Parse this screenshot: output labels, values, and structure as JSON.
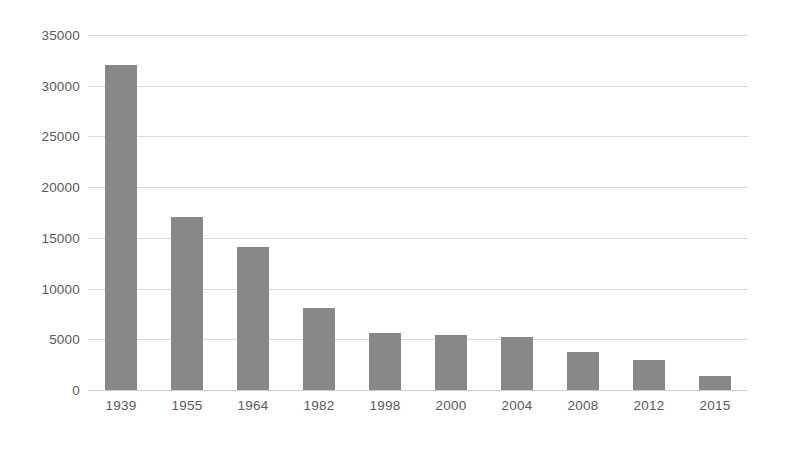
{
  "chart_data": {
    "type": "bar",
    "title": "",
    "subtitle": "",
    "xlabel": "",
    "ylabel": "",
    "categories": [
      "1939",
      "1955",
      "1964",
      "1982",
      "1998",
      "2000",
      "2004",
      "2008",
      "2012",
      "2015"
    ],
    "values": [
      32000,
      17100,
      14100,
      8100,
      5600,
      5400,
      5200,
      3700,
      3000,
      1400
    ],
    "series": [
      {
        "name": "",
        "values": [
          32000,
          17100,
          14100,
          8100,
          5600,
          5400,
          5200,
          3700,
          3000,
          1400
        ]
      }
    ],
    "ylim": [
      0,
      35000
    ],
    "ytick_labels": [
      "0",
      "5000",
      "10000",
      "15000",
      "20000",
      "25000",
      "30000",
      "35000"
    ],
    "ytick_values": [
      0,
      5000,
      10000,
      15000,
      20000,
      25000,
      30000,
      35000
    ],
    "grid": true,
    "grid_axis": "y",
    "legend": false,
    "legend_position": "none",
    "annotations": [],
    "colors": {
      "bar": "#888888",
      "gridline": "#d9d9d9",
      "axis_text": "#5a5a5a",
      "background": "#ffffff"
    }
  }
}
